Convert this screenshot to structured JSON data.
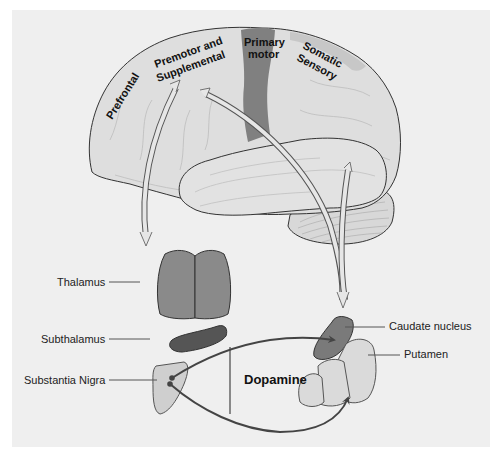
{
  "diagram": {
    "type": "basal-ganglia-circuit",
    "cortex_regions": [
      {
        "id": "prefrontal",
        "label": "Prefrontal"
      },
      {
        "id": "premotor",
        "label_line1": "Premotor and",
        "label_line2": "Supplemental"
      },
      {
        "id": "primary-motor",
        "label_line1": "Primary",
        "label_line2": "motor"
      },
      {
        "id": "somatic-sensory",
        "label_line1": "Somatic",
        "label_line2": "Sensory"
      }
    ],
    "structures": [
      {
        "id": "thalamus",
        "label": "Thalamus"
      },
      {
        "id": "subthalamus",
        "label": "Subthalamus"
      },
      {
        "id": "substantia-nigra",
        "label": "Substantia Nigra"
      },
      {
        "id": "caudate-nucleus",
        "label": "Caudate nucleus"
      },
      {
        "id": "putamen",
        "label": "Putamen"
      }
    ],
    "pathway_label": "Dopamine",
    "colors": {
      "background_panel": "#efefef",
      "cortex": "#dcdcdc",
      "primary_motor": "#7f7f7f",
      "thalamus": "#8a8a8a",
      "subthalamus": "#555555",
      "substantia_nigra": "#cfcfcf",
      "caudate": "#7a7a7a",
      "putamen": "#dadada",
      "pathway": "#444444"
    }
  }
}
